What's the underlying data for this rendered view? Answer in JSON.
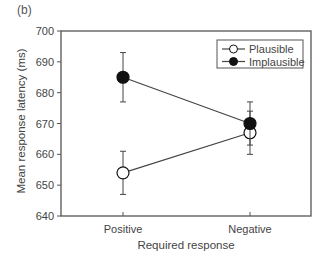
{
  "panel_label": "(b)",
  "chart_data": {
    "type": "line",
    "title": "",
    "xlabel": "Required response",
    "ylabel": "Mean response latency (ms)",
    "categories": [
      "Positive",
      "Negative"
    ],
    "ylim": [
      640,
      700
    ],
    "yticks": [
      640,
      650,
      660,
      670,
      680,
      690,
      700
    ],
    "grid": false,
    "legend_position": "upper right",
    "series": [
      {
        "name": "Plausible",
        "marker": "open-circle",
        "values": [
          654,
          667
        ],
        "error_low": [
          647,
          660
        ],
        "error_high": [
          661,
          674
        ]
      },
      {
        "name": "Implausible",
        "marker": "filled-circle",
        "values": [
          685,
          670
        ],
        "error_low": [
          677,
          663
        ],
        "error_high": [
          693,
          677
        ]
      }
    ]
  },
  "colors": {
    "axis": "#555555",
    "line": "#444444",
    "marker_fill": "#111111",
    "open_marker_fill": "#ffffff"
  }
}
